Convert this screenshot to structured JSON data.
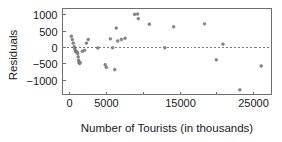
{
  "chart_data": {
    "type": "scatter",
    "title": "",
    "xlabel": "Number of Tourists (in thousands)",
    "ylabel": "Residuals",
    "xlim": [
      -900,
      27500
    ],
    "ylim": [
      -1450,
      1180
    ],
    "grid": false,
    "legend": null,
    "reference_line": {
      "orientation": "horizontal",
      "value": 0,
      "style": "dashed"
    },
    "xticks": [
      0,
      5000,
      10000,
      15000,
      20000,
      25000
    ],
    "xticklabels": [
      "0",
      "5000",
      "",
      "15000",
      "",
      "25000"
    ],
    "yticks": [
      -1000,
      -500,
      0,
      500,
      1000
    ],
    "yticklabels": [
      "−1000",
      "−500",
      "0",
      "500",
      "1000"
    ],
    "point_color": "#8a8a8a",
    "point_edge_color": "#5d5d5d",
    "points": [
      {
        "x": 300,
        "y": 330
      },
      {
        "x": 430,
        "y": 230
      },
      {
        "x": 560,
        "y": 120
      },
      {
        "x": 700,
        "y": 10
      },
      {
        "x": 780,
        "y": -60
      },
      {
        "x": 860,
        "y": -120
      },
      {
        "x": 930,
        "y": -140
      },
      {
        "x": 1010,
        "y": -150
      },
      {
        "x": 1090,
        "y": -160
      },
      {
        "x": 1150,
        "y": -200
      },
      {
        "x": 1230,
        "y": -300
      },
      {
        "x": 1290,
        "y": -400
      },
      {
        "x": 1350,
        "y": -470
      },
      {
        "x": 1420,
        "y": -500
      },
      {
        "x": 1500,
        "y": -480
      },
      {
        "x": 1800,
        "y": -130
      },
      {
        "x": 2100,
        "y": -100
      },
      {
        "x": 2350,
        "y": 120
      },
      {
        "x": 2600,
        "y": 230
      },
      {
        "x": 3900,
        "y": -30
      },
      {
        "x": 4900,
        "y": -540
      },
      {
        "x": 5050,
        "y": -620
      },
      {
        "x": 5600,
        "y": 250
      },
      {
        "x": 5900,
        "y": -20
      },
      {
        "x": 6200,
        "y": -690
      },
      {
        "x": 6400,
        "y": 580
      },
      {
        "x": 6600,
        "y": 185
      },
      {
        "x": 7100,
        "y": 230
      },
      {
        "x": 7600,
        "y": 270
      },
      {
        "x": 8900,
        "y": 1000
      },
      {
        "x": 9300,
        "y": 1010
      },
      {
        "x": 9400,
        "y": 870
      },
      {
        "x": 10900,
        "y": 700
      },
      {
        "x": 13000,
        "y": -20
      },
      {
        "x": 14200,
        "y": 620
      },
      {
        "x": 18400,
        "y": 710
      },
      {
        "x": 20000,
        "y": -390
      },
      {
        "x": 20900,
        "y": 90
      },
      {
        "x": 23200,
        "y": -1310
      },
      {
        "x": 26100,
        "y": -580
      }
    ]
  }
}
